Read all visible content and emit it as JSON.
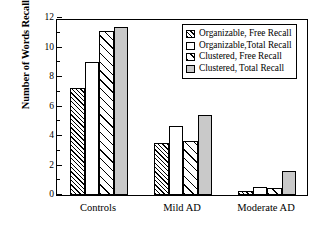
{
  "chart_data": {
    "type": "bar",
    "title": "",
    "subtitle": "",
    "xlabel": "",
    "ylabel": "Number of Words Recalled",
    "categories": [
      "Controls",
      "Mild AD",
      "Moderate AD"
    ],
    "series": [
      {
        "name": "Organizable, Free Recall",
        "pattern": "dense-diagonal-hatch",
        "values": [
          7.25,
          3.55,
          0.25
        ]
      },
      {
        "name": "Organizable,Total Recall",
        "pattern": "white-open",
        "values": [
          9.0,
          4.7,
          0.55
        ]
      },
      {
        "name": "Clustered, Free Recall",
        "pattern": "wide-diagonal-hatch",
        "values": [
          11.1,
          3.65,
          0.5
        ]
      },
      {
        "name": "Clustered, Total Recall",
        "pattern": "solid-gray",
        "values": [
          11.4,
          5.4,
          1.65
        ]
      }
    ],
    "ylim": [
      0,
      12
    ],
    "yticks": [
      0,
      2,
      4,
      6,
      8,
      10,
      12
    ],
    "ytick_labels": [
      "0",
      "2",
      "4",
      "6",
      "8",
      "10",
      "12"
    ],
    "yminor_ticks": [
      1,
      3,
      5,
      7,
      9,
      11
    ],
    "grid": false,
    "legend_position": "top-right",
    "colors": {
      "axis": "#000000",
      "bar_edge": "#000000",
      "gray_fill": "#c9c9c9",
      "background": "#ffffff"
    }
  },
  "legend": {
    "entries": [
      {
        "label": "Organizable, Free Recall"
      },
      {
        "label": "Organizable,Total Recall"
      },
      {
        "label": "Clustered, Free Recall"
      },
      {
        "label": "Clustered, Total Recall"
      }
    ]
  }
}
